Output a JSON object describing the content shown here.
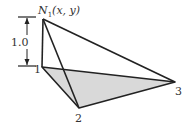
{
  "diagram": {
    "apex_label_main": "N",
    "apex_label_sub": "1",
    "apex_label_args": "(x, y)",
    "dimension_label": "1.0",
    "node_labels": [
      "1",
      "2",
      "3"
    ],
    "colors": {
      "stroke": "#222222",
      "fill": "#d9d9d9",
      "text": "#333333"
    }
  }
}
